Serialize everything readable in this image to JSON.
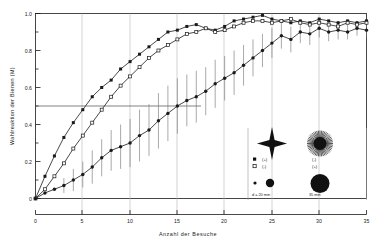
{
  "chart_data": {
    "type": "line",
    "title": "",
    "xlabel": "Anzahl  der  Besuche",
    "ylabel": "Wahlreaktion  der  Bienen  (M)",
    "xlim": [
      0,
      35
    ],
    "ylim": [
      0,
      1.0
    ],
    "xticks": [
      0,
      5,
      10,
      15,
      20,
      25,
      30,
      35
    ],
    "xticklabels": [
      "0",
      "5",
      "10",
      "15",
      "20",
      "25",
      "30",
      "35"
    ],
    "yticks": [
      0,
      0.2,
      0.4,
      0.6,
      0.8,
      1.0
    ],
    "yticklabels": [
      "0",
      "0.2",
      "0.4",
      "0.6",
      "0.8",
      "1.0"
    ],
    "grid": false,
    "reference_lines": [
      {
        "axis": "y",
        "value": 0.5,
        "x_from": 0,
        "x_to": 17.5
      }
    ],
    "legend_position": "lower-right-inset",
    "series": [
      {
        "name": "filled-square-upper",
        "marker": "filled-square",
        "legend_symbol": "(+)",
        "x": [
          0,
          1,
          2,
          3,
          4,
          5,
          6,
          7,
          8,
          9,
          10,
          11,
          12,
          13,
          14,
          15,
          16,
          17,
          18,
          19,
          20,
          21,
          22,
          23,
          24,
          25,
          26,
          27,
          28,
          29,
          30,
          31,
          32,
          33,
          34,
          35
        ],
        "y": [
          0.0,
          0.12,
          0.23,
          0.33,
          0.41,
          0.48,
          0.55,
          0.6,
          0.64,
          0.7,
          0.74,
          0.78,
          0.82,
          0.86,
          0.9,
          0.91,
          0.93,
          0.94,
          0.92,
          0.91,
          0.93,
          0.96,
          0.97,
          0.98,
          0.99,
          0.97,
          0.96,
          0.95,
          0.96,
          0.95,
          0.97,
          0.96,
          0.95,
          0.96,
          0.95,
          0.96
        ]
      },
      {
        "name": "open-square-upper",
        "marker": "open-square",
        "legend_symbol": "(-)",
        "x": [
          0,
          1,
          2,
          3,
          4,
          5,
          6,
          7,
          8,
          9,
          10,
          11,
          12,
          13,
          14,
          15,
          16,
          17,
          18,
          19,
          20,
          21,
          22,
          23,
          24,
          25,
          26,
          27,
          28,
          29,
          30,
          31,
          32,
          33,
          34,
          35
        ],
        "y": [
          0.0,
          0.05,
          0.12,
          0.19,
          0.27,
          0.34,
          0.41,
          0.48,
          0.55,
          0.61,
          0.66,
          0.71,
          0.76,
          0.8,
          0.83,
          0.86,
          0.89,
          0.9,
          0.92,
          0.9,
          0.91,
          0.93,
          0.95,
          0.96,
          0.96,
          0.95,
          0.96,
          0.97,
          0.95,
          0.94,
          0.95,
          0.94,
          0.93,
          0.95,
          0.94,
          0.95
        ]
      },
      {
        "name": "filled-circle-lower",
        "marker": "filled-circle",
        "legend_symbol": "(+)",
        "x": [
          0,
          1,
          2,
          3,
          4,
          5,
          6,
          7,
          8,
          9,
          10,
          11,
          12,
          13,
          14,
          15,
          16,
          17,
          18,
          19,
          20,
          21,
          22,
          23,
          24,
          25,
          26,
          27,
          28,
          29,
          30,
          31,
          32,
          33,
          34,
          35
        ],
        "y": [
          0.0,
          0.03,
          0.05,
          0.07,
          0.1,
          0.13,
          0.17,
          0.22,
          0.26,
          0.28,
          0.3,
          0.34,
          0.37,
          0.42,
          0.46,
          0.5,
          0.53,
          0.55,
          0.58,
          0.62,
          0.65,
          0.68,
          0.72,
          0.76,
          0.8,
          0.84,
          0.88,
          0.86,
          0.9,
          0.89,
          0.92,
          0.9,
          0.91,
          0.9,
          0.92,
          0.91
        ],
        "error_bars": [
          0.0,
          0.0,
          0.0,
          0.04,
          0.06,
          0.07,
          0.09,
          0.1,
          0.11,
          0.12,
          0.13,
          0.14,
          0.14,
          0.15,
          0.15,
          0.15,
          0.14,
          0.14,
          0.13,
          0.13,
          0.12,
          0.12,
          0.11,
          0.1,
          0.09,
          0.08,
          0.07,
          0.07,
          0.06,
          0.06,
          0.05,
          0.05,
          0.05,
          0.04,
          0.04,
          0.04
        ]
      }
    ]
  },
  "axis": {
    "ylabel": "Wahlreaktion  der  Bienen  (M)",
    "xlabel": "Anzahl  der  Besuche",
    "xticks": [
      "0",
      "5",
      "10",
      "15",
      "20",
      "25",
      "30",
      "35"
    ],
    "yticks": [
      "1.0",
      "0.8",
      "0.6",
      "0.4",
      "0.2",
      "0"
    ]
  },
  "legend": {
    "star_left_name": "four-point-star",
    "star_right_name": "sunburst-star",
    "rows": [
      {
        "left_marker": "filled-square",
        "left_text": "(+)",
        "right_text": "(-)"
      },
      {
        "left_marker": "open-square",
        "left_text": "(-)",
        "right_text": "(+)"
      }
    ],
    "size_left": "d = 20 mm",
    "size_right": "35 mm"
  },
  "colors": {
    "line": "#1a1a1a",
    "axis": "#1a1a1a",
    "error": "#6e6e6e",
    "guide": "#8a8a8a"
  }
}
